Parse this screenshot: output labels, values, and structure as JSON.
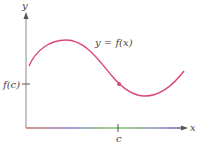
{
  "figure": {
    "axis_labels": {
      "x": "x",
      "y": "y"
    },
    "curve_label": "y = f(x)",
    "x_tick_label": "c",
    "y_tick_label": "f(c)",
    "colors": {
      "curve": "#d9467a",
      "point": "#d9467a",
      "y_axis": "#8a8a8a",
      "x_axis_gradient": [
        "#c0785a",
        "#8a7fd0",
        "#7fbf6a",
        "#8a7fd0",
        "#555555"
      ],
      "text": "#444444",
      "background": "#ffffff"
    },
    "geometry": {
      "origin": [
        26,
        128
      ],
      "x_axis_end": [
        187,
        128
      ],
      "y_axis_end": [
        26,
        12
      ],
      "point_c": [
        119,
        84
      ],
      "x_tick_x": 118,
      "y_tick_y": 84
    }
  }
}
